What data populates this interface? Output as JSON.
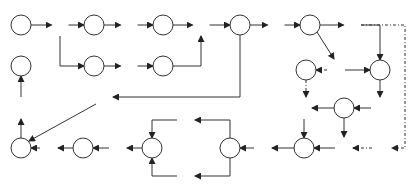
{
  "diagram": {
    "type": "petri-net",
    "colors": {
      "stroke": "#333333",
      "background": "#ffffff",
      "text": "#222222"
    },
    "transitions": [
      {
        "id": "A",
        "label": "A"
      },
      {
        "id": "B",
        "label": "B"
      },
      {
        "id": "C",
        "label": "C"
      },
      {
        "id": "E",
        "label": "E"
      },
      {
        "id": "F",
        "label": "F"
      },
      {
        "id": "G",
        "label": "G"
      },
      {
        "id": "H",
        "label": "H"
      },
      {
        "id": "I",
        "label": "I"
      },
      {
        "id": "J",
        "label": "J"
      },
      {
        "id": "K",
        "label": "K"
      },
      {
        "id": "M",
        "label": "M"
      },
      {
        "id": "Q",
        "label": "Q"
      },
      {
        "id": "S",
        "label": "S"
      },
      {
        "id": "U",
        "label": "U"
      },
      {
        "id": "V",
        "label": "V"
      },
      {
        "id": "X",
        "label": "X"
      },
      {
        "id": "Y",
        "label": "Y"
      }
    ],
    "places": [
      "p1",
      "p2",
      "p3",
      "p4",
      "p5",
      "p6",
      "p7",
      "p8",
      "p9",
      "p10",
      "p11",
      "p12",
      "p13",
      "p14",
      "p15",
      "p16",
      "p17",
      "p18"
    ],
    "arcs": [
      {
        "from": "p1",
        "to": "A"
      },
      {
        "from": "A",
        "to": "p2"
      },
      {
        "from": "A",
        "to": "p4"
      },
      {
        "from": "p2",
        "to": "B"
      },
      {
        "from": "B",
        "to": "p3"
      },
      {
        "from": "p3",
        "to": "E"
      },
      {
        "from": "p4",
        "to": "C"
      },
      {
        "from": "C",
        "to": "p5"
      },
      {
        "from": "p5",
        "to": "E"
      },
      {
        "from": "E",
        "to": "p6"
      },
      {
        "from": "p6",
        "to": "F"
      },
      {
        "from": "p6",
        "to": "Y"
      },
      {
        "from": "F",
        "to": "p7"
      },
      {
        "from": "p7",
        "to": "G"
      },
      {
        "from": "p7",
        "to": "H"
      },
      {
        "from": "G",
        "to": "p9"
      },
      {
        "from": "G",
        "to": "p18",
        "style": "dashed"
      },
      {
        "from": "H",
        "to": "p9"
      },
      {
        "from": "H",
        "to": "p8",
        "style": "dashed"
      },
      {
        "from": "p8",
        "to": "J",
        "style": "dashed"
      },
      {
        "from": "p9",
        "to": "I"
      },
      {
        "from": "I",
        "to": "p10"
      },
      {
        "from": "p10",
        "to": "J"
      },
      {
        "from": "p10",
        "to": "K"
      },
      {
        "from": "J",
        "to": "p11"
      },
      {
        "from": "p18",
        "to": "K",
        "style": "dashed"
      },
      {
        "from": "K",
        "to": "p11"
      },
      {
        "from": "p11",
        "to": "M"
      },
      {
        "from": "M",
        "to": "p12"
      },
      {
        "from": "p12",
        "to": "Q"
      },
      {
        "from": "p12",
        "to": "S"
      },
      {
        "from": "Q",
        "to": "p13"
      },
      {
        "from": "S",
        "to": "p13"
      },
      {
        "from": "p13",
        "to": "U"
      },
      {
        "from": "U",
        "to": "p14"
      },
      {
        "from": "p14",
        "to": "V"
      },
      {
        "from": "V",
        "to": "p15"
      },
      {
        "from": "Y",
        "to": "p15"
      },
      {
        "from": "p15",
        "to": "X"
      },
      {
        "from": "X",
        "to": "p16"
      }
    ]
  }
}
